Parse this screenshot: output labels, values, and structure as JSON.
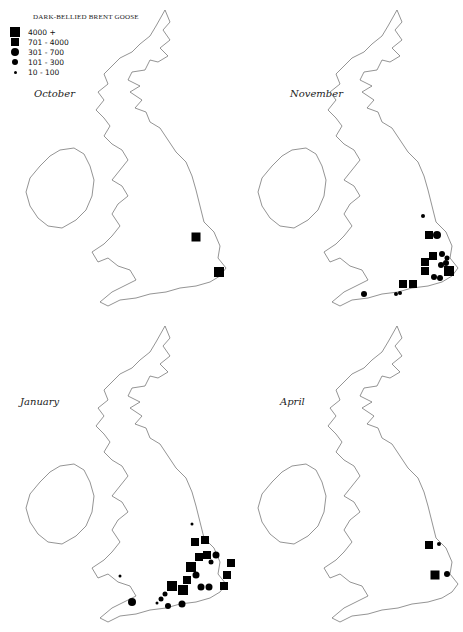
{
  "title": "DARK-BELLIED BRENT GOOSE",
  "legend": [
    {
      "label": "4000 +",
      "shape": "square",
      "size": 10
    },
    {
      "label": "701 - 4000",
      "shape": "square",
      "size": 8
    },
    {
      "label": "301 - 700",
      "shape": "circle",
      "size": 8
    },
    {
      "label": "101 - 300",
      "shape": "circle",
      "size": 6
    },
    {
      "label": "10 - 100",
      "shape": "circle",
      "size": 3
    }
  ],
  "panels": [
    {
      "month": "October",
      "symbols": [
        {
          "x": 196,
          "y": 237,
          "shape": "square",
          "size": 9
        },
        {
          "x": 219,
          "y": 272,
          "shape": "square",
          "size": 10
        }
      ]
    },
    {
      "month": "November",
      "symbols": [
        {
          "x": 423,
          "y": 216,
          "shape": "circle",
          "size": 4
        },
        {
          "x": 429,
          "y": 235,
          "shape": "square",
          "size": 8
        },
        {
          "x": 437,
          "y": 235,
          "shape": "circle",
          "size": 8
        },
        {
          "x": 433,
          "y": 256,
          "shape": "square",
          "size": 8
        },
        {
          "x": 425,
          "y": 262,
          "shape": "square",
          "size": 8
        },
        {
          "x": 442,
          "y": 254,
          "shape": "circle",
          "size": 6
        },
        {
          "x": 447,
          "y": 258,
          "shape": "circle",
          "size": 5
        },
        {
          "x": 446,
          "y": 263,
          "shape": "circle",
          "size": 6
        },
        {
          "x": 441,
          "y": 265,
          "shape": "circle",
          "size": 6
        },
        {
          "x": 425,
          "y": 271,
          "shape": "square",
          "size": 8
        },
        {
          "x": 449,
          "y": 271,
          "shape": "square",
          "size": 10
        },
        {
          "x": 434,
          "y": 277,
          "shape": "circle",
          "size": 6
        },
        {
          "x": 440,
          "y": 278,
          "shape": "circle",
          "size": 6
        },
        {
          "x": 403,
          "y": 284,
          "shape": "square",
          "size": 8
        },
        {
          "x": 413,
          "y": 284,
          "shape": "square",
          "size": 8
        },
        {
          "x": 364,
          "y": 294,
          "shape": "circle",
          "size": 6
        },
        {
          "x": 396,
          "y": 294,
          "shape": "circle",
          "size": 4
        },
        {
          "x": 400,
          "y": 293,
          "shape": "circle",
          "size": 4
        }
      ]
    },
    {
      "month": "January",
      "symbols": [
        {
          "x": 192,
          "y": 524,
          "shape": "circle",
          "size": 3
        },
        {
          "x": 195,
          "y": 542,
          "shape": "square",
          "size": 8
        },
        {
          "x": 205,
          "y": 540,
          "shape": "square",
          "size": 8
        },
        {
          "x": 199,
          "y": 557,
          "shape": "square",
          "size": 8
        },
        {
          "x": 207,
          "y": 555,
          "shape": "square",
          "size": 8
        },
        {
          "x": 216,
          "y": 555,
          "shape": "circle",
          "size": 7
        },
        {
          "x": 211,
          "y": 562,
          "shape": "circle",
          "size": 5
        },
        {
          "x": 231,
          "y": 563,
          "shape": "square",
          "size": 8
        },
        {
          "x": 191,
          "y": 567,
          "shape": "square",
          "size": 10
        },
        {
          "x": 227,
          "y": 575,
          "shape": "square",
          "size": 8
        },
        {
          "x": 196,
          "y": 575,
          "shape": "circle",
          "size": 7
        },
        {
          "x": 187,
          "y": 580,
          "shape": "square",
          "size": 8
        },
        {
          "x": 224,
          "y": 586,
          "shape": "square",
          "size": 8
        },
        {
          "x": 201,
          "y": 587,
          "shape": "circle",
          "size": 7
        },
        {
          "x": 209,
          "y": 587,
          "shape": "circle",
          "size": 7
        },
        {
          "x": 172,
          "y": 586,
          "shape": "square",
          "size": 10
        },
        {
          "x": 183,
          "y": 590,
          "shape": "square",
          "size": 10
        },
        {
          "x": 165,
          "y": 594,
          "shape": "circle",
          "size": 5
        },
        {
          "x": 161,
          "y": 599,
          "shape": "circle",
          "size": 5
        },
        {
          "x": 132,
          "y": 602,
          "shape": "circle",
          "size": 8
        },
        {
          "x": 157,
          "y": 603,
          "shape": "circle",
          "size": 3
        },
        {
          "x": 168,
          "y": 606,
          "shape": "circle",
          "size": 6
        },
        {
          "x": 182,
          "y": 604,
          "shape": "circle",
          "size": 7
        },
        {
          "x": 120,
          "y": 576,
          "shape": "circle",
          "size": 3
        }
      ]
    },
    {
      "month": "April",
      "symbols": [
        {
          "x": 429,
          "y": 545,
          "shape": "square",
          "size": 8
        },
        {
          "x": 439,
          "y": 544,
          "shape": "circle",
          "size": 4
        },
        {
          "x": 435,
          "y": 575,
          "shape": "square",
          "size": 9
        },
        {
          "x": 447,
          "y": 574,
          "shape": "circle",
          "size": 6
        }
      ]
    }
  ]
}
